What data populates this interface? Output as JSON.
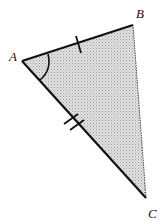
{
  "diagram": {
    "type": "triangle",
    "vertices": {
      "A": {
        "label": "A",
        "x": 22,
        "y": 61
      },
      "B": {
        "label": "B",
        "x": 133,
        "y": 25
      },
      "C": {
        "label": "C",
        "x": 146,
        "y": 198
      }
    },
    "shading": "#c8c8c8",
    "markings": {
      "AB_ticks": 1,
      "AC_ticks": 2,
      "angle_mark_at": "A"
    }
  }
}
